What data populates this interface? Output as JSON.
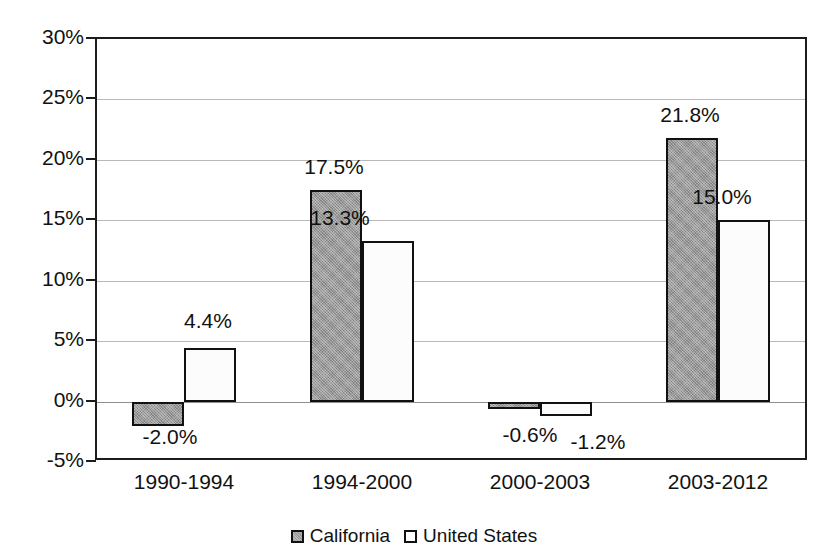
{
  "chart_data": {
    "type": "bar",
    "title": "",
    "xlabel": "",
    "ylabel": "",
    "ylim": [
      -5,
      30
    ],
    "ytick_labels": [
      "30%",
      "25%",
      "20%",
      "15%",
      "10%",
      "5%",
      "0%",
      "-5%"
    ],
    "ytick_values": [
      30,
      25,
      20,
      15,
      10,
      5,
      0,
      -5
    ],
    "grid": true,
    "legend_position": "bottom-center",
    "categories": [
      "1990-1994",
      "1994-2000",
      "2000-2003",
      "2003-2012"
    ],
    "series": [
      {
        "name": "California",
        "color": "#9a9a9a",
        "values": [
          -2.0,
          17.5,
          -0.6,
          21.8
        ],
        "labels": [
          "-2.0%",
          "17.5%",
          "-0.6%",
          "21.8%"
        ]
      },
      {
        "name": "United States",
        "color": "#ffffff",
        "values": [
          4.4,
          13.3,
          -1.2,
          15.0
        ],
        "labels": [
          "4.4%",
          "13.3%",
          "-1.2%",
          "15.0%"
        ]
      }
    ]
  },
  "legend": {
    "entries": [
      {
        "label": "California"
      },
      {
        "label": "United States"
      }
    ]
  },
  "colors": {
    "california_fill": "#9a9a9a",
    "united_states_fill": "#ffffff",
    "axis": "#1c1c1c",
    "gridline": "#b9b9b9",
    "text": "#111111"
  }
}
